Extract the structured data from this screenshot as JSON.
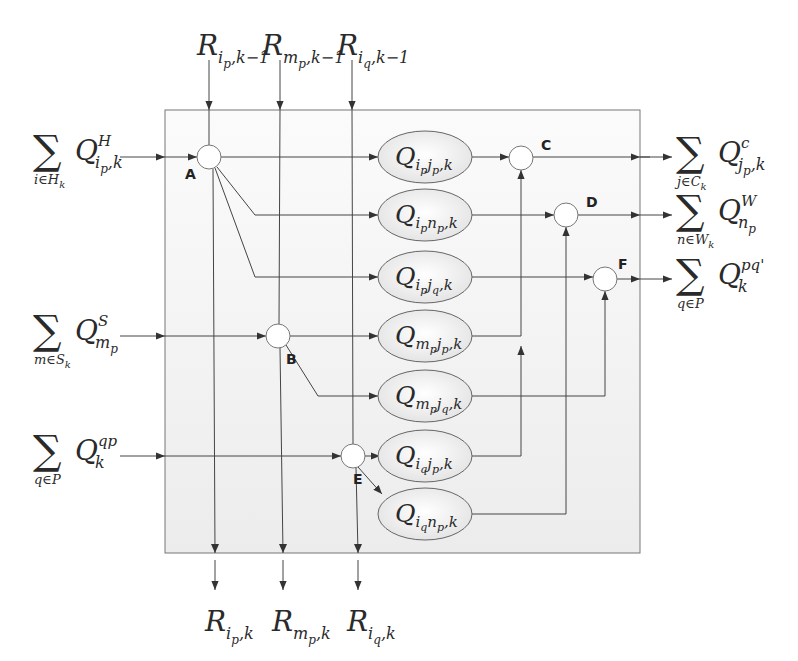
{
  "diagram": {
    "title": "",
    "box": {
      "x": 165,
      "y": 110,
      "w": 475,
      "h": 443
    },
    "colors": {
      "line": "#444444",
      "box_fill": "#f4f4f4",
      "ellipse_fill": "#eeeeee",
      "node_fill": "#ffffff",
      "text": "#2a2a2a"
    },
    "top_inputs": [
      {
        "id": "R_ip_km1",
        "base": "R",
        "sub1": "i",
        "sub2": "p",
        "tail": ",k−1",
        "x": 209
      },
      {
        "id": "R_mp_km1",
        "base": "R",
        "sub1": "m",
        "sub2": "p",
        "tail": ",k−1",
        "x": 280
      },
      {
        "id": "R_iq_km1",
        "base": "R",
        "sub1": "i",
        "sub2": "q",
        "tail": ",k−1",
        "x": 352
      }
    ],
    "bottom_outputs": [
      {
        "id": "R_ip_k",
        "base": "R",
        "sub1": "i",
        "sub2": "p",
        "tail": ",k",
        "x": 215
      },
      {
        "id": "R_mp_k",
        "base": "R",
        "sub1": "m",
        "sub2": "p",
        "tail": ",k",
        "x": 283
      },
      {
        "id": "R_iq_k",
        "base": "R",
        "sub1": "i",
        "sub2": "q",
        "tail": ",k",
        "x": 358
      }
    ],
    "left_inputs": [
      {
        "id": "sum_H",
        "sigma": "∑",
        "below": "i∈H",
        "below_sub": "k",
        "base": "Q",
        "sup": "H",
        "sub": "i",
        "subsub": "p",
        "tail": ",k",
        "y": 157
      },
      {
        "id": "sum_S",
        "sigma": "∑",
        "below": "m∈S",
        "below_sub": "k",
        "base": "Q",
        "sup": "S",
        "sub": "m",
        "subsub": "p",
        "tail": "",
        "y": 336
      },
      {
        "id": "sum_qp",
        "sigma": "∑",
        "below": "q∈P",
        "below_sub": "",
        "base": "Q",
        "sup": "qp",
        "sub": "k",
        "subsub": "",
        "tail": "",
        "y": 456
      }
    ],
    "right_outputs": [
      {
        "id": "sum_C",
        "sigma": "∑",
        "below": "j∈C",
        "below_sub": "k",
        "base": "Q",
        "sup": "c",
        "sub": "j",
        "subsub": "p",
        "tail": ",k",
        "y": 158
      },
      {
        "id": "sum_W",
        "sigma": "∑",
        "below": "n∈W",
        "below_sub": "k",
        "base": "Q",
        "sup": "W",
        "sub": "n",
        "subsub": "p",
        "tail": "",
        "y": 215
      },
      {
        "id": "sum_pq",
        "sigma": "∑",
        "below": "q∈P",
        "below_sub": "",
        "base": "Q",
        "sup": "pq'",
        "sub": "k",
        "subsub": "",
        "tail": "",
        "y": 279
      }
    ],
    "nodes": [
      {
        "label": "A",
        "cx": 209,
        "cy": 157
      },
      {
        "label": "B",
        "cx": 278,
        "cy": 336
      },
      {
        "label": "C",
        "cx": 521,
        "cy": 158
      },
      {
        "label": "D",
        "cx": 566,
        "cy": 215
      },
      {
        "label": "E",
        "cx": 353,
        "cy": 456
      },
      {
        "label": "F",
        "cx": 605,
        "cy": 279
      }
    ],
    "flows": [
      {
        "base": "Q",
        "s1": "i",
        "s1s": "p",
        "s2": "j",
        "s2s": "p",
        "tail": ",k",
        "cy": 157
      },
      {
        "base": "Q",
        "s1": "i",
        "s1s": "p",
        "s2": "n",
        "s2s": "p",
        "tail": ",k",
        "cy": 215
      },
      {
        "base": "Q",
        "s1": "i",
        "s1s": "p",
        "s2": "j",
        "s2s": "q",
        "tail": ",k",
        "cy": 277
      },
      {
        "base": "Q",
        "s1": "m",
        "s1s": "p",
        "s2": "j",
        "s2s": "p",
        "tail": ",k",
        "cy": 336
      },
      {
        "base": "Q",
        "s1": "m",
        "s1s": "p",
        "s2": "j",
        "s2s": "q",
        "tail": ",k",
        "cy": 396
      },
      {
        "base": "Q",
        "s1": "i",
        "s1s": "q",
        "s2": "j",
        "s2s": "p",
        "tail": ",k",
        "cy": 456
      },
      {
        "base": "Q",
        "s1": "i",
        "s1s": "q",
        "s2": "n",
        "s2s": "p",
        "tail": ",k",
        "cy": 514
      }
    ]
  }
}
